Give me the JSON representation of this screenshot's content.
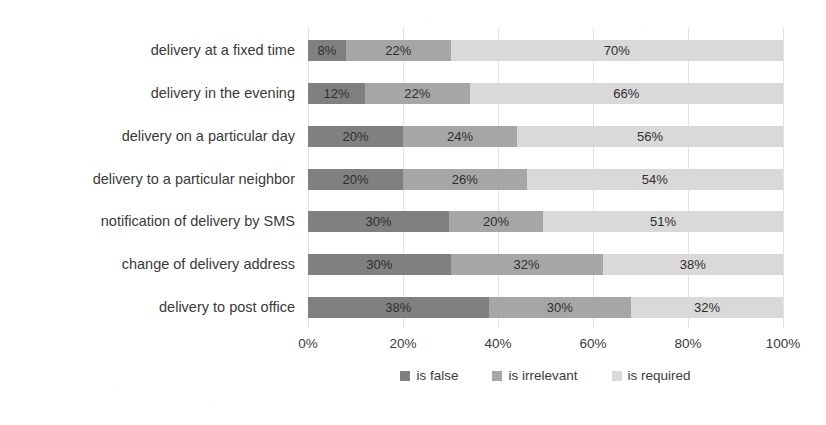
{
  "chart_data": {
    "type": "bar",
    "orientation": "horizontal",
    "stacked": true,
    "stack_mode": "percent",
    "title": "",
    "subtitle": "",
    "xlabel": "",
    "ylabel": "",
    "xlim": [
      0,
      100
    ],
    "xticks": [
      "0%",
      "20%",
      "40%",
      "60%",
      "80%",
      "100%"
    ],
    "xtick_values": [
      0,
      20,
      40,
      60,
      80,
      100
    ],
    "grid": true,
    "grid_axis": "x",
    "legend_position": "bottom-center",
    "categories": [
      "delivery at a fixed time",
      "delivery in the evening",
      "delivery on a particular day",
      "delivery to a particular neighbor",
      "notification of delivery by SMS",
      "change of delivery address",
      "delivery to post office"
    ],
    "series": [
      {
        "name": "is false",
        "color": "#808080",
        "values": [
          8,
          12,
          20,
          20,
          30,
          30,
          38
        ],
        "labels": [
          "8%",
          "12%",
          "20%",
          "20%",
          "30%",
          "30%",
          "38%"
        ]
      },
      {
        "name": "is irrelevant",
        "color": "#a6a6a6",
        "values": [
          22,
          22,
          24,
          26,
          20,
          32,
          30
        ],
        "labels": [
          "22%",
          "22%",
          "24%",
          "26%",
          "20%",
          "32%",
          "30%"
        ]
      },
      {
        "name": "is required",
        "color": "#d9d9d9",
        "values": [
          70,
          66,
          56,
          54,
          51,
          38,
          32
        ],
        "labels": [
          "70%",
          "66%",
          "56%",
          "54%",
          "51%",
          "38%",
          "32%"
        ]
      }
    ]
  },
  "legend": {
    "items": [
      {
        "label": "is false",
        "color": "#808080"
      },
      {
        "label": "is irrelevant",
        "color": "#a6a6a6"
      },
      {
        "label": "is required",
        "color": "#d9d9d9"
      }
    ]
  },
  "colors": {
    "background": "#ffffff",
    "text": "#3a3a3a",
    "gridline": "#e2e2e2",
    "series_false": "#808080",
    "series_irrelevant": "#a6a6a6",
    "series_required": "#d9d9d9"
  }
}
